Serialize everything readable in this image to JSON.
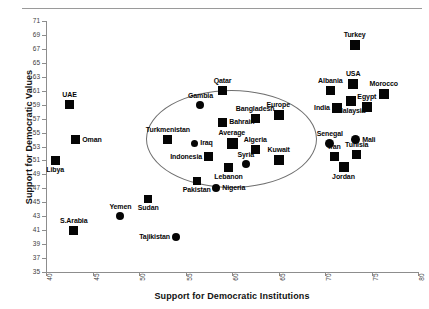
{
  "chart_data": {
    "type": "scatter",
    "title": "",
    "xlabel": "Support for Democratic Institutions",
    "ylabel": "Support for Democratic Values",
    "xlim": [
      40,
      80
    ],
    "ylim": [
      35,
      71
    ],
    "xticks": [
      40,
      45,
      50,
      55,
      60,
      65,
      70,
      75,
      80
    ],
    "yticks": [
      35,
      37,
      39,
      41,
      43,
      45,
      47,
      49,
      51,
      53,
      55,
      57,
      59,
      61,
      63,
      65,
      67,
      69,
      71
    ],
    "grid": false,
    "legend": "none",
    "annotations": [
      {
        "name": "cluster-ellipse",
        "shape": "ellipse",
        "x_center": 59.8,
        "y_center": 54.2,
        "x_radius": 9.1,
        "y_radius": 6.9
      }
    ],
    "points": [
      {
        "label": "UAE",
        "x": 42.5,
        "y": 59.0,
        "marker": "square",
        "size": 9,
        "label_pos": "top"
      },
      {
        "label": "Oman",
        "x": 43.2,
        "y": 54.0,
        "marker": "square",
        "size": 9,
        "label_pos": "right"
      },
      {
        "label": "Libya",
        "x": 41.0,
        "y": 51.0,
        "marker": "square",
        "size": 9,
        "label_pos": "bottom"
      },
      {
        "label": "S.Arabia",
        "x": 43.0,
        "y": 41.0,
        "marker": "square",
        "size": 9,
        "label_pos": "top"
      },
      {
        "label": "Yemen",
        "x": 48.0,
        "y": 43.0,
        "marker": "circle",
        "size": 8,
        "label_pos": "top"
      },
      {
        "label": "Sudan",
        "x": 51.0,
        "y": 45.5,
        "marker": "square",
        "size": 8,
        "label_pos": "bottom"
      },
      {
        "label": "Tajikistan",
        "x": 54.0,
        "y": 40.0,
        "marker": "circle",
        "size": 8,
        "label_pos": "left"
      },
      {
        "label": "Pakistan",
        "x": 56.2,
        "y": 48.0,
        "marker": "square",
        "size": 8,
        "label_pos": "bottom"
      },
      {
        "label": "Nigeria",
        "x": 58.3,
        "y": 47.0,
        "marker": "circle",
        "size": 8,
        "label_pos": "right"
      },
      {
        "label": "Turkmenistan",
        "x": 53.1,
        "y": 54.0,
        "marker": "square",
        "size": 9,
        "label_pos": "top"
      },
      {
        "label": "Gambia",
        "x": 56.6,
        "y": 59.0,
        "marker": "circle",
        "size": 8,
        "label_pos": "top"
      },
      {
        "label": "Qatar",
        "x": 59.0,
        "y": 61.0,
        "marker": "square",
        "size": 9,
        "label_pos": "top"
      },
      {
        "label": "Bahrain",
        "x": 59.0,
        "y": 56.5,
        "marker": "square",
        "size": 9,
        "label_pos": "right"
      },
      {
        "label": "Iraq",
        "x": 56.0,
        "y": 53.5,
        "marker": "circle",
        "size": 7,
        "label_pos": "right"
      },
      {
        "label": "Indonesia",
        "x": 57.5,
        "y": 51.5,
        "marker": "square",
        "size": 9,
        "label_pos": "left"
      },
      {
        "label": "Average",
        "x": 60.0,
        "y": 53.5,
        "marker": "square",
        "size": 11,
        "label_pos": "top"
      },
      {
        "label": "Lebanon",
        "x": 59.6,
        "y": 50.0,
        "marker": "square",
        "size": 9,
        "label_pos": "bottom"
      },
      {
        "label": "Syria",
        "x": 61.5,
        "y": 50.5,
        "marker": "circle",
        "size": 8,
        "label_pos": "top"
      },
      {
        "label": "Algeria",
        "x": 62.5,
        "y": 52.5,
        "marker": "square",
        "size": 9,
        "label_pos": "top"
      },
      {
        "label": "Bangladesh",
        "x": 62.5,
        "y": 57.0,
        "marker": "square",
        "size": 9,
        "label_pos": "top"
      },
      {
        "label": "Europe",
        "x": 65.0,
        "y": 57.5,
        "marker": "square",
        "size": 10,
        "label_pos": "top"
      },
      {
        "label": "Kuwait",
        "x": 65.0,
        "y": 51.0,
        "marker": "square",
        "size": 10,
        "label_pos": "top"
      },
      {
        "label": "Senegal",
        "x": 70.5,
        "y": 53.5,
        "marker": "circle",
        "size": 9,
        "label_pos": "top"
      },
      {
        "label": "Iran",
        "x": 71.0,
        "y": 51.5,
        "marker": "square",
        "size": 9,
        "label_pos": "top"
      },
      {
        "label": "Jordan",
        "x": 72.0,
        "y": 50.0,
        "marker": "square",
        "size": 10,
        "label_pos": "bottom"
      },
      {
        "label": "Mali",
        "x": 73.3,
        "y": 54.0,
        "marker": "circle",
        "size": 9,
        "label_pos": "right"
      },
      {
        "label": "Tunisia",
        "x": 73.4,
        "y": 51.8,
        "marker": "square",
        "size": 9,
        "label_pos": "top"
      },
      {
        "label": "India",
        "x": 71.3,
        "y": 58.5,
        "marker": "square",
        "size": 10,
        "label_pos": "left"
      },
      {
        "label": "Albania",
        "x": 70.6,
        "y": 61.0,
        "marker": "square",
        "size": 9,
        "label_pos": "top"
      },
      {
        "label": "Malaysia",
        "x": 72.8,
        "y": 59.5,
        "marker": "square",
        "size": 10,
        "label_pos": "bottom"
      },
      {
        "label": "USA",
        "x": 73.0,
        "y": 62.0,
        "marker": "square",
        "size": 10,
        "label_pos": "top"
      },
      {
        "label": "Turkey",
        "x": 73.2,
        "y": 67.5,
        "marker": "square",
        "size": 10,
        "label_pos": "top"
      },
      {
        "label": "Egypt",
        "x": 74.5,
        "y": 58.7,
        "marker": "square",
        "size": 10,
        "label_pos": "top"
      },
      {
        "label": "Morocco",
        "x": 76.3,
        "y": 60.5,
        "marker": "square",
        "size": 10,
        "label_pos": "top"
      }
    ]
  }
}
